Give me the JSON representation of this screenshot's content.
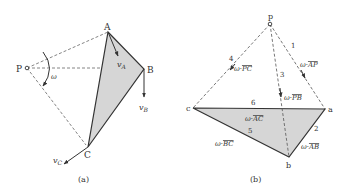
{
  "panel_a": {
    "caption": "(a)",
    "points": {
      "A": "A",
      "B": "B",
      "C": "C",
      "P": "P"
    },
    "omega": "ω",
    "velocities": {
      "vA": {
        "v": "v",
        "sub": "A"
      },
      "vB": {
        "v": "v",
        "sub": "B"
      },
      "vC": {
        "v": "v",
        "sub": "C"
      }
    }
  },
  "panel_b": {
    "caption": "(b)",
    "points": {
      "p": "p",
      "a": "a",
      "b": "b",
      "c": "c"
    },
    "edge_numbers": [
      "1",
      "2",
      "3",
      "4",
      "5",
      "6"
    ],
    "labels": {
      "AP": {
        "prefix": "ω·",
        "bar": "AP"
      },
      "AB": {
        "prefix": "ω·",
        "bar": "AB"
      },
      "PB": {
        "prefix": "ω·",
        "bar": "PB"
      },
      "PC": {
        "prefix": "ω·",
        "bar": "PC"
      },
      "BC": {
        "prefix": "ω·",
        "bar": "BC"
      },
      "AC": {
        "prefix": "ω·",
        "bar": "AC"
      }
    }
  },
  "colors": {
    "fill": "#d6d6d6",
    "line": "#333333",
    "dash": "#555555"
  }
}
